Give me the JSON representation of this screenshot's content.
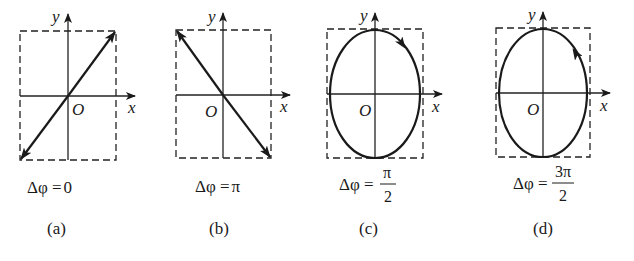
{
  "figure": {
    "axes": {
      "x_label": "x",
      "y_label": "y",
      "origin_label": "O"
    },
    "panels": [
      {
        "id": "a",
        "caption": "(a)",
        "phase_label_prefix": "Δφ =",
        "phase_value": "0",
        "trajectory": "straight line through origin, positive slope (lower-left to upper-right), arrows at both ends"
      },
      {
        "id": "b",
        "caption": "(b)",
        "phase_label_prefix": "Δφ =",
        "phase_value": "π",
        "trajectory": "straight line through origin, negative slope (upper-left to lower-right), arrows at both ends"
      },
      {
        "id": "c",
        "caption": "(c)",
        "phase_label_prefix": "Δφ =",
        "phase_numerator": "π",
        "phase_denominator": "2",
        "trajectory": "upright ellipse centered at origin, direction clockwise"
      },
      {
        "id": "d",
        "caption": "(d)",
        "phase_label_prefix": "Δφ =",
        "phase_numerator": "3π",
        "phase_denominator": "2",
        "trajectory": "upright ellipse centered at origin, direction counterclockwise"
      }
    ],
    "colors": {
      "ink": "#1a1a1a",
      "background": "#ffffff"
    }
  }
}
